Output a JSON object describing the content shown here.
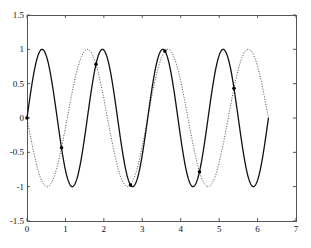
{
  "chart_data": {
    "type": "line",
    "title": "",
    "xlabel": "",
    "ylabel": "",
    "xlim": [
      0,
      7
    ],
    "ylim": [
      -1.5,
      1.5
    ],
    "grid": false,
    "legend": null,
    "x_ticks": [
      0,
      1,
      2,
      3,
      4,
      5,
      6,
      7
    ],
    "x_tick_labels": [
      "0",
      "1",
      "2",
      "3",
      "4",
      "5",
      "6",
      "7"
    ],
    "y_ticks": [
      1.5,
      1,
      0.5,
      0,
      -0.5,
      -1,
      -1.5
    ],
    "y_tick_labels": [
      "1.5",
      "1",
      "0.5",
      "0",
      "-0.5",
      "-1",
      "-1.5"
    ],
    "series": [
      {
        "name": "sin(4x)",
        "style": "solid",
        "color": "#111111",
        "x_range": [
          0,
          6.2832
        ],
        "function": "sin(4x)",
        "key_points": [
          {
            "x": 0,
            "y": 0
          },
          {
            "x": 0.39,
            "y": 1
          },
          {
            "x": 1.18,
            "y": -1
          },
          {
            "x": 1.96,
            "y": 1
          },
          {
            "x": 2.75,
            "y": -1
          },
          {
            "x": 3.53,
            "y": 1
          },
          {
            "x": 4.32,
            "y": -1
          },
          {
            "x": 5.11,
            "y": 1
          },
          {
            "x": 5.89,
            "y": -1
          },
          {
            "x": 6.28,
            "y": 0
          }
        ]
      },
      {
        "name": "-sin(3x)",
        "style": "dotted",
        "color": "#333333",
        "x_range": [
          0,
          6.2832
        ],
        "function": "-sin(3x)",
        "key_points": [
          {
            "x": 0,
            "y": 0
          },
          {
            "x": 0.52,
            "y": -1
          },
          {
            "x": 1.57,
            "y": 1
          },
          {
            "x": 2.62,
            "y": -1
          },
          {
            "x": 3.67,
            "y": 1
          },
          {
            "x": 4.71,
            "y": -1
          },
          {
            "x": 5.76,
            "y": 1
          },
          {
            "x": 6.28,
            "y": 0
          }
        ]
      },
      {
        "name": "intersections",
        "style": "markers",
        "color": "#000000",
        "points": [
          {
            "x": 0.0,
            "y": 0.0
          },
          {
            "x": 0.898,
            "y": -0.434
          },
          {
            "x": 1.795,
            "y": 0.782
          },
          {
            "x": 2.693,
            "y": -0.975
          },
          {
            "x": 3.59,
            "y": 0.975
          },
          {
            "x": 4.488,
            "y": -0.782
          },
          {
            "x": 5.386,
            "y": 0.434
          }
        ]
      }
    ]
  },
  "plot_area": {
    "left": 27,
    "top": 15,
    "right": 296,
    "bottom": 221
  }
}
